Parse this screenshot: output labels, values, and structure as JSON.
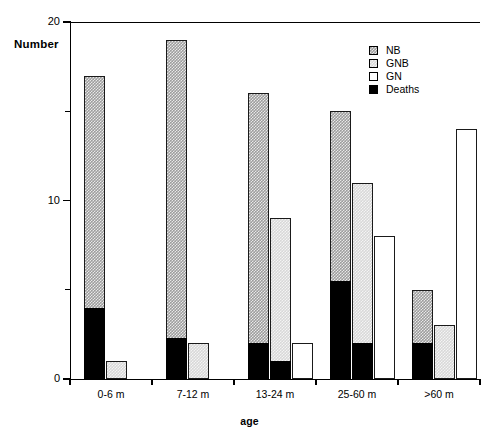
{
  "chart_data": {
    "type": "bar",
    "title": "",
    "xlabel": "age",
    "ylabel": "Number",
    "categories": [
      "0-6  m",
      "7-12  m",
      "13-24  m",
      "25-60  m",
      ">60  m"
    ],
    "ylim": [
      0,
      20
    ],
    "yticks": [
      0,
      10,
      20
    ],
    "ytick_labels": [
      "0",
      "10",
      "20"
    ],
    "yminor_ticks": [
      5,
      15
    ],
    "grid": false,
    "legend_position": "top-right",
    "series": [
      {
        "name": "NB",
        "color": "#9d9d9d",
        "pattern": "checker-dark",
        "values": [
          17,
          19,
          16,
          15,
          5
        ]
      },
      {
        "name": "GNB",
        "color": "#d8d8d8",
        "pattern": "checker-light",
        "values": [
          1,
          2,
          9,
          11,
          3
        ]
      },
      {
        "name": "GN",
        "color": "#ffffff",
        "pattern": "solid",
        "values": [
          0,
          0,
          2,
          8,
          14
        ]
      },
      {
        "name": "Deaths",
        "color": "#000000",
        "pattern": "solid",
        "values_nb": [
          4,
          2.3,
          2,
          5.5,
          2
        ],
        "values_gnb": [
          0,
          0,
          1,
          2,
          0
        ],
        "values_gn": [
          0,
          0,
          0,
          0,
          0
        ]
      }
    ]
  },
  "legend": {
    "items": [
      {
        "label": "NB"
      },
      {
        "label": "GNB"
      },
      {
        "label": "GN"
      },
      {
        "label": "Deaths"
      }
    ]
  },
  "axes": {
    "y_title": "Number",
    "x_title": "age"
  }
}
